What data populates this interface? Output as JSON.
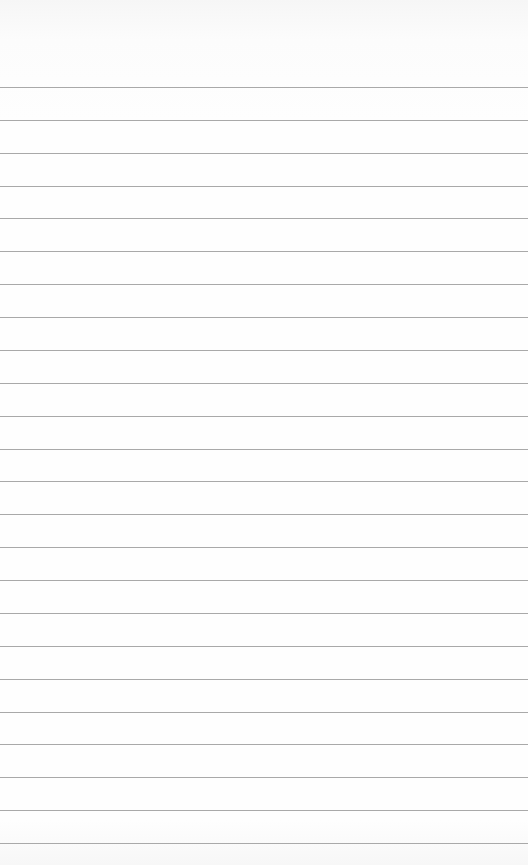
{
  "paper": {
    "type": "ruled-notepad-sheet",
    "background_color": "#fefefe",
    "line_color": "#9a9a9a",
    "first_line_y": 87,
    "line_spacing": 32.87,
    "line_count": 24,
    "text_lines": []
  }
}
